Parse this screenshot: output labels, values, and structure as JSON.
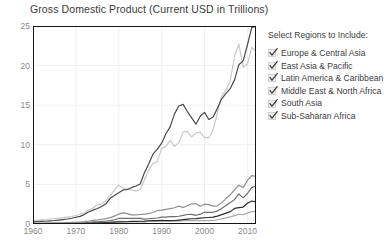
{
  "chart_data": {
    "type": "line",
    "title": "Gross Domestic Product (Current USD in Trillions)",
    "xlabel": "",
    "ylabel": "",
    "xlim": [
      1960,
      2012
    ],
    "ylim": [
      0,
      25
    ],
    "xticks": [
      1960,
      1970,
      1980,
      1990,
      2000,
      2010
    ],
    "yticks": [
      0,
      5,
      10,
      15,
      20,
      25
    ],
    "grid": true,
    "legend_position": "right",
    "x": [
      1960,
      1961,
      1962,
      1963,
      1964,
      1965,
      1966,
      1967,
      1968,
      1969,
      1970,
      1971,
      1972,
      1973,
      1974,
      1975,
      1976,
      1977,
      1978,
      1979,
      1980,
      1981,
      1982,
      1983,
      1984,
      1985,
      1986,
      1987,
      1988,
      1989,
      1990,
      1991,
      1992,
      1993,
      1994,
      1995,
      1996,
      1997,
      1998,
      1999,
      2000,
      2001,
      2002,
      2003,
      2004,
      2005,
      2006,
      2007,
      2008,
      2009,
      2010,
      2011,
      2012
    ],
    "series": [
      {
        "name": "Europe & Central Asia",
        "color": "#c9c9c9",
        "values": [
          0.45,
          0.48,
          0.52,
          0.57,
          0.63,
          0.69,
          0.75,
          0.8,
          0.87,
          0.95,
          1.07,
          1.2,
          1.43,
          1.8,
          2.02,
          2.42,
          2.55,
          2.92,
          3.62,
          4.32,
          4.9,
          4.55,
          4.4,
          4.28,
          4.15,
          4.35,
          5.6,
          6.85,
          7.65,
          7.9,
          9.55,
          9.8,
          10.6,
          9.8,
          10.3,
          11.6,
          11.7,
          11.0,
          11.5,
          11.6,
          10.9,
          10.9,
          11.9,
          14.0,
          16.2,
          16.9,
          18.1,
          21.2,
          22.7,
          19.8,
          20.2,
          22.3,
          21.8
        ]
      },
      {
        "name": "East Asia & Pacific",
        "color": "#4a4a4a",
        "values": [
          0.26,
          0.29,
          0.32,
          0.35,
          0.4,
          0.44,
          0.5,
          0.56,
          0.63,
          0.73,
          0.85,
          0.96,
          1.2,
          1.55,
          1.75,
          1.95,
          2.2,
          2.55,
          3.25,
          3.6,
          3.95,
          4.3,
          4.35,
          4.6,
          4.8,
          5.05,
          6.5,
          7.6,
          8.85,
          9.45,
          10.2,
          11.4,
          12.3,
          13.9,
          14.9,
          15.1,
          14.2,
          13.4,
          12.6,
          13.6,
          14.1,
          13.2,
          13.5,
          14.6,
          15.8,
          16.5,
          17.1,
          18.2,
          20.1,
          20.6,
          22.6,
          24.8,
          25.0
        ]
      },
      {
        "name": "Latin America & Caribbean",
        "color": "#8f8f8f",
        "values": [
          0.08,
          0.09,
          0.1,
          0.11,
          0.12,
          0.13,
          0.15,
          0.16,
          0.18,
          0.2,
          0.22,
          0.25,
          0.29,
          0.36,
          0.46,
          0.52,
          0.6,
          0.69,
          0.8,
          1.0,
          1.25,
          1.4,
          1.3,
          1.15,
          1.15,
          1.2,
          1.25,
          1.3,
          1.45,
          1.7,
          1.75,
          1.85,
          1.95,
          2.05,
          2.25,
          2.1,
          2.3,
          2.55,
          2.55,
          2.25,
          2.5,
          2.45,
          2.25,
          2.3,
          2.7,
          3.2,
          3.7,
          4.3,
          4.9,
          4.6,
          5.5,
          6.1,
          6.0
        ]
      },
      {
        "name": "Middle East & North Africa",
        "color": "#6e6e6e",
        "values": [
          0.02,
          0.02,
          0.03,
          0.03,
          0.03,
          0.04,
          0.04,
          0.05,
          0.05,
          0.06,
          0.07,
          0.09,
          0.11,
          0.15,
          0.26,
          0.28,
          0.33,
          0.38,
          0.42,
          0.54,
          0.7,
          0.72,
          0.7,
          0.7,
          0.7,
          0.7,
          0.62,
          0.66,
          0.7,
          0.76,
          0.87,
          0.86,
          0.92,
          0.93,
          0.98,
          1.08,
          1.2,
          1.22,
          1.1,
          1.24,
          1.48,
          1.46,
          1.48,
          1.66,
          1.95,
          2.35,
          2.7,
          3.1,
          3.8,
          3.3,
          3.85,
          4.6,
          4.8
        ]
      },
      {
        "name": "South Asia",
        "color": "#2e2e2e",
        "values": [
          0.05,
          0.05,
          0.05,
          0.06,
          0.07,
          0.07,
          0.07,
          0.08,
          0.08,
          0.09,
          0.1,
          0.1,
          0.11,
          0.13,
          0.15,
          0.16,
          0.16,
          0.19,
          0.22,
          0.24,
          0.26,
          0.28,
          0.29,
          0.32,
          0.32,
          0.35,
          0.37,
          0.41,
          0.44,
          0.43,
          0.47,
          0.43,
          0.43,
          0.44,
          0.5,
          0.56,
          0.62,
          0.66,
          0.68,
          0.74,
          0.79,
          0.82,
          0.86,
          1.0,
          1.18,
          1.37,
          1.56,
          1.97,
          2.06,
          2.14,
          2.62,
          2.9,
          2.8
        ]
      },
      {
        "name": "Sub-Saharan Africa",
        "color": "#a8a8a8",
        "values": [
          0.03,
          0.03,
          0.03,
          0.04,
          0.04,
          0.05,
          0.05,
          0.05,
          0.06,
          0.06,
          0.07,
          0.08,
          0.09,
          0.11,
          0.15,
          0.17,
          0.18,
          0.2,
          0.22,
          0.27,
          0.33,
          0.32,
          0.3,
          0.28,
          0.27,
          0.26,
          0.28,
          0.32,
          0.34,
          0.35,
          0.38,
          0.38,
          0.37,
          0.36,
          0.36,
          0.41,
          0.43,
          0.44,
          0.42,
          0.43,
          0.44,
          0.43,
          0.44,
          0.54,
          0.65,
          0.77,
          0.9,
          1.05,
          1.23,
          1.17,
          1.37,
          1.55,
          1.6
        ]
      }
    ]
  },
  "legend": {
    "title": "Select Regions to Include:",
    "items": [
      {
        "label": "Europe & Central Asia",
        "checked": true
      },
      {
        "label": "East Asia & Pacific",
        "checked": true
      },
      {
        "label": "Latin America & Caribbean",
        "checked": true
      },
      {
        "label": "Middle East & North Africa",
        "checked": true
      },
      {
        "label": "South Asia",
        "checked": true
      },
      {
        "label": "Sub-Saharan Africa",
        "checked": true
      }
    ]
  }
}
